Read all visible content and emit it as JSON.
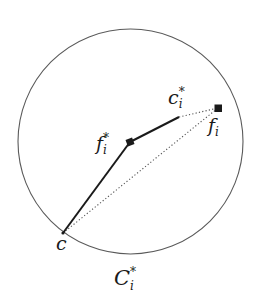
{
  "diagram": {
    "type": "geometric-illustration",
    "circle": {
      "label": {
        "base": "C",
        "subscript": "i",
        "superscript": "*"
      },
      "stroke_color": "#5a5a5a"
    },
    "points": {
      "c": {
        "label": {
          "base": "c",
          "subscript": "",
          "superscript": ""
        },
        "marker": "none"
      },
      "f_i_star": {
        "label": {
          "base": "f",
          "subscript": "i",
          "superscript": "*"
        },
        "marker": "filled-square"
      },
      "c_i_star": {
        "label": {
          "base": "c",
          "subscript": "i",
          "superscript": "*"
        },
        "marker": "none"
      },
      "f_i": {
        "label": {
          "base": "f",
          "subscript": "i",
          "superscript": ""
        },
        "marker": "filled-square"
      }
    },
    "edges": [
      {
        "from": "c",
        "to": "f_i_star",
        "style": "solid-thick"
      },
      {
        "from": "f_i_star",
        "to": "c_i_star",
        "style": "solid-thick"
      },
      {
        "from": "c_i_star",
        "to": "f_i",
        "style": "dotted"
      },
      {
        "from": "c",
        "to": "f_i",
        "style": "dotted"
      }
    ],
    "colors": {
      "line": "#1a1a1a",
      "dotted": "#555555",
      "circle": "#5a5a5a",
      "background": "#ffffff"
    }
  }
}
